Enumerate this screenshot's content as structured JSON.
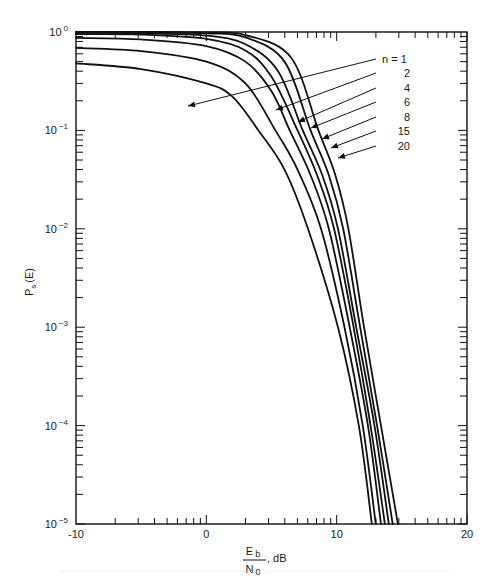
{
  "chart_data": {
    "type": "line",
    "title": "",
    "xlabel": "E_b / N_0, dB",
    "ylabel": "P_s (E)",
    "xlim": [
      -10,
      20
    ],
    "ylim": [
      1e-05,
      1
    ],
    "yscale": "log",
    "grid": false,
    "x_ticks": [
      -10,
      0,
      10,
      20
    ],
    "x_tick_labels": [
      "-10",
      "0",
      "10",
      "20"
    ],
    "y_ticks": [
      1,
      0.1,
      0.01,
      0.001,
      0.0001,
      1e-05
    ],
    "y_tick_labels": [
      {
        "base": "10",
        "exp": "0"
      },
      {
        "base": "10",
        "exp": "−1"
      },
      {
        "base": "10",
        "exp": "−2"
      },
      {
        "base": "10",
        "exp": "−3"
      },
      {
        "base": "10",
        "exp": "−4"
      },
      {
        "base": "10",
        "exp": "−5"
      }
    ],
    "legend_position": "annotated arrows, upper right",
    "series": [
      {
        "name": "n = 1",
        "label": "n = 1",
        "x": [
          -10,
          -5,
          0,
          2,
          4,
          6,
          7.8,
          10.1,
          11.7,
          12.7
        ],
        "y": [
          0.48,
          0.42,
          0.3,
          0.22,
          0.1,
          0.04,
          0.01,
          0.001,
          0.0001,
          1e-05
        ]
      },
      {
        "name": "n = 2",
        "label": "2",
        "x": [
          -10,
          -5,
          0,
          3,
          5.3,
          7,
          8.8,
          10.6,
          12.0,
          13.0
        ],
        "y": [
          0.69,
          0.64,
          0.5,
          0.3,
          0.1,
          0.04,
          0.01,
          0.001,
          0.0001,
          1e-05
        ]
      },
      {
        "name": "n = 4",
        "label": "4",
        "x": [
          -10,
          -5,
          0,
          3,
          5,
          6.4,
          8,
          9.4,
          11.0,
          12.4,
          13.4
        ],
        "y": [
          0.87,
          0.84,
          0.72,
          0.5,
          0.25,
          0.1,
          0.035,
          0.01,
          0.001,
          0.0001,
          1e-05
        ]
      },
      {
        "name": "n = 6",
        "label": "6",
        "x": [
          -10,
          -5,
          0,
          3,
          5,
          7.0,
          8.5,
          9.8,
          11.3,
          12.6,
          13.7
        ],
        "y": [
          0.95,
          0.94,
          0.85,
          0.65,
          0.35,
          0.1,
          0.035,
          0.01,
          0.001,
          0.0001,
          1e-05
        ]
      },
      {
        "name": "n = 8",
        "label": "8",
        "x": [
          -10,
          -5,
          0,
          3,
          5.5,
          7.4,
          8.9,
          10.1,
          11.5,
          12.9,
          14.0
        ],
        "y": [
          0.98,
          0.97,
          0.92,
          0.75,
          0.4,
          0.1,
          0.035,
          0.01,
          0.001,
          0.0001,
          1e-05
        ]
      },
      {
        "name": "n = 15",
        "label": "15",
        "x": [
          -10,
          -5,
          0,
          3,
          6,
          8.0,
          9.4,
          10.5,
          11.8,
          13.1,
          14.3
        ],
        "y": [
          1.0,
          0.995,
          0.97,
          0.88,
          0.5,
          0.1,
          0.035,
          0.01,
          0.001,
          0.0001,
          1e-05
        ]
      },
      {
        "name": "n = 20",
        "label": "20",
        "x": [
          -10,
          -5,
          0,
          3,
          6.5,
          8.6,
          9.9,
          10.9,
          12.1,
          13.4,
          14.7
        ],
        "y": [
          1.0,
          1.0,
          0.99,
          0.93,
          0.55,
          0.1,
          0.035,
          0.01,
          0.001,
          0.0001,
          1e-05
        ]
      }
    ]
  },
  "legend": {
    "labels": [
      "n = 1",
      "2",
      "4",
      "6",
      "8",
      "15",
      "20"
    ]
  },
  "axes": {
    "y_label_main": "P",
    "y_label_sub": "s",
    "y_label_tail": "(E)",
    "x_label_num": "E",
    "x_label_num_sub": "b",
    "x_label_den": "N",
    "x_label_den_sub": "0",
    "x_label_unit": ", dB"
  },
  "colors": {
    "line": "#111111",
    "background": "#ffffff"
  }
}
